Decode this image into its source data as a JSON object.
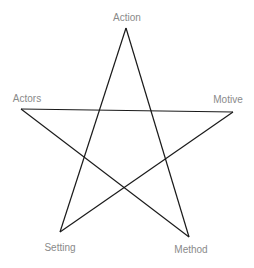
{
  "diagram": {
    "type": "pentagram",
    "stroke_color": "#1a1a1a",
    "label_color": "#8a8a8a",
    "vertices": [
      {
        "id": "action",
        "label": "Action",
        "x": 126,
        "y": 28,
        "label_x": 127,
        "label_y": 13
      },
      {
        "id": "actors",
        "label": "Actors",
        "x": 21,
        "y": 109,
        "label_x": 27,
        "label_y": 94
      },
      {
        "id": "motive",
        "label": "Motive",
        "x": 233,
        "y": 112,
        "label_x": 228,
        "label_y": 95
      },
      {
        "id": "setting",
        "label": "Setting",
        "x": 60,
        "y": 232,
        "label_x": 60,
        "label_y": 243
      },
      {
        "id": "method",
        "label": "Method",
        "x": 189,
        "y": 237,
        "label_x": 191,
        "label_y": 245
      }
    ],
    "edges": [
      [
        "action",
        "setting"
      ],
      [
        "action",
        "method"
      ],
      [
        "actors",
        "motive"
      ],
      [
        "actors",
        "method"
      ],
      [
        "motive",
        "setting"
      ]
    ]
  }
}
